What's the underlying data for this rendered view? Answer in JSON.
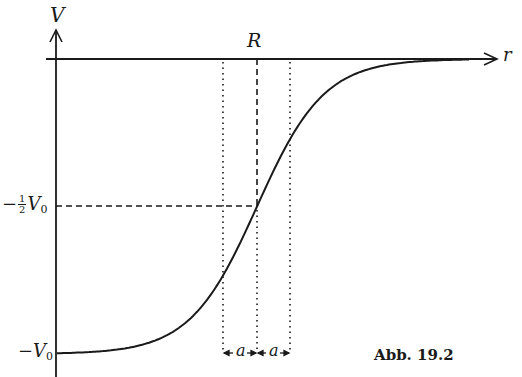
{
  "figure": {
    "caption": "Abb. 19.2",
    "axes": {
      "y_label": "V",
      "x_label": "r"
    },
    "markers": {
      "radius_label": "R",
      "half_depth_label_prefix": "−",
      "half_depth_frac_num": "1",
      "half_depth_frac_den": "2",
      "half_depth_symbol": "V",
      "half_depth_sub": "0",
      "depth_label_prefix": "−",
      "depth_symbol": "V",
      "depth_sub": "0",
      "diffuseness_left": "a",
      "diffuseness_right": "a"
    },
    "curve": {
      "type": "woods-saxon",
      "formula": "V(r) = -V0 / (1 + exp((r - R)/a))"
    },
    "colors": {
      "ink": "#1a1a1a",
      "background": "#ffffff"
    }
  },
  "layout": {
    "origin_x": 56,
    "zero_y": 59,
    "depth_y": 354,
    "half_y": 206,
    "R_x": 257,
    "a_px": 33.5,
    "curve_end_x": 470,
    "axis_end_x": 496,
    "y_axis_top": 28
  }
}
